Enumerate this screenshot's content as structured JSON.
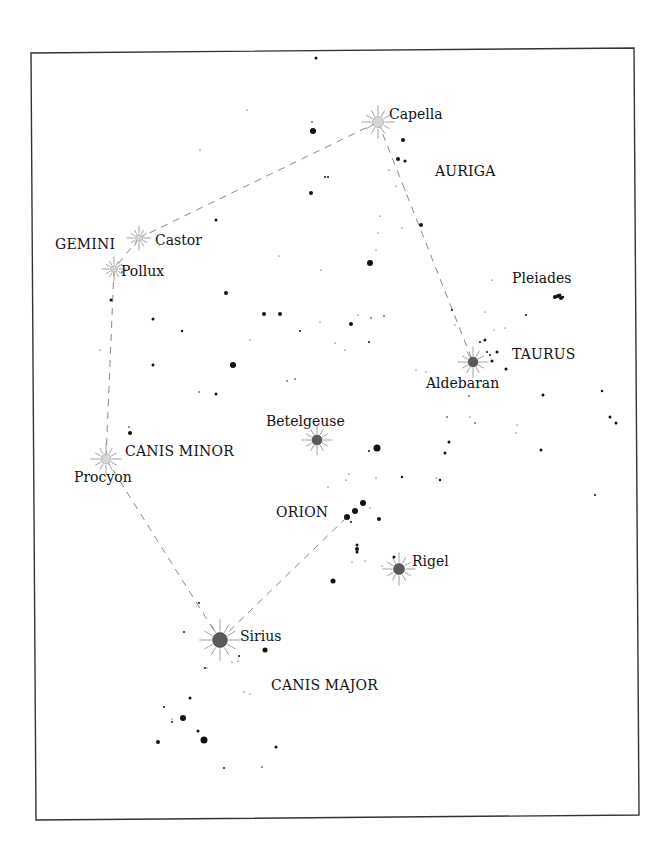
{
  "frame": {
    "corners": [
      [
        31,
        53
      ],
      [
        634,
        48
      ],
      [
        639,
        815
      ],
      [
        36,
        820
      ]
    ],
    "stroke": "#333333"
  },
  "colors": {
    "star": "#111111",
    "line": "#888888",
    "bright_light": "#d6d6d6",
    "bright_dark": "#5a5a5a",
    "ray": "#8a8a8a"
  },
  "constellations": [
    {
      "name": "AURIGA",
      "x": 435,
      "y": 176
    },
    {
      "name": "GEMINI",
      "x": 55,
      "y": 249
    },
    {
      "name": "TAURUS",
      "x": 512,
      "y": 359
    },
    {
      "name": "CANIS MINOR",
      "x": 125,
      "y": 456
    },
    {
      "name": "ORION",
      "x": 276,
      "y": 517
    },
    {
      "name": "CANIS MAJOR",
      "x": 271,
      "y": 690
    }
  ],
  "bright_stars": [
    {
      "name": "Capella",
      "x": 378,
      "y": 122,
      "r": 5.5,
      "style": "light",
      "label_x": 389,
      "label_y": 119
    },
    {
      "name": "Castor",
      "x": 139,
      "y": 238,
      "r": 3.5,
      "style": "light",
      "label_x": 155,
      "label_y": 245
    },
    {
      "name": "Pollux",
      "x": 114,
      "y": 269,
      "r": 3.5,
      "style": "light",
      "label_x": 121,
      "label_y": 276
    },
    {
      "name": "Aldebaran",
      "x": 473,
      "y": 362,
      "r": 5,
      "style": "dark",
      "label_x": 426,
      "label_y": 388
    },
    {
      "name": "Betelgeuse",
      "x": 317,
      "y": 440,
      "r": 5,
      "style": "dark",
      "label_x": 266,
      "label_y": 426
    },
    {
      "name": "Procyon",
      "x": 106,
      "y": 459,
      "r": 5,
      "style": "light",
      "label_x": 74,
      "label_y": 482
    },
    {
      "name": "Rigel",
      "x": 399,
      "y": 569,
      "r": 5.5,
      "style": "dark",
      "label_x": 412,
      "label_y": 566
    },
    {
      "name": "Sirius",
      "x": 220,
      "y": 640,
      "r": 7.5,
      "style": "dark",
      "label_x": 240,
      "label_y": 641
    }
  ],
  "labels_extra": [
    {
      "name": "Pleiades",
      "x": 512,
      "y": 283
    }
  ],
  "connections": [
    [
      "Capella",
      "Castor"
    ],
    [
      "Castor",
      "Pollux"
    ],
    [
      "Pollux",
      "Procyon"
    ],
    [
      "Procyon",
      "Sirius"
    ],
    [
      "Sirius",
      "Orion-belt"
    ],
    [
      "Capella",
      "Aldebaran"
    ]
  ],
  "anchors": {
    "Orion-belt": [
      347,
      517
    ]
  },
  "stars": [
    [
      316,
      58,
      1.5
    ],
    [
      247,
      110,
      0.6
    ],
    [
      313,
      131,
      3
    ],
    [
      312,
      122,
      0.8
    ],
    [
      311,
      193,
      2
    ],
    [
      325,
      177,
      1
    ],
    [
      328,
      177,
      1
    ],
    [
      403,
      140,
      2
    ],
    [
      398,
      159,
      2
    ],
    [
      405,
      161,
      1.5
    ],
    [
      389,
      170,
      0.6
    ],
    [
      396,
      186,
      0.6
    ],
    [
      405,
      190,
      0.6
    ],
    [
      421,
      225,
      2
    ],
    [
      402,
      228,
      0.6
    ],
    [
      380,
      216,
      0.6
    ],
    [
      378,
      233,
      0.6
    ],
    [
      376,
      250,
      0.6
    ],
    [
      216,
      220,
      1.5
    ],
    [
      200,
      150,
      0.6
    ],
    [
      370,
      263,
      3
    ],
    [
      279,
      256,
      0.6
    ],
    [
      321,
      270,
      0.6
    ],
    [
      226,
      293,
      2
    ],
    [
      264,
      314,
      2
    ],
    [
      280,
      314,
      2
    ],
    [
      153,
      319,
      1.5
    ],
    [
      182,
      331,
      1.2
    ],
    [
      300,
      331,
      1
    ],
    [
      351,
      324,
      2
    ],
    [
      369,
      342,
      1
    ],
    [
      358,
      315,
      0.6
    ],
    [
      371,
      318,
      0.8
    ],
    [
      384,
      316,
      0.8
    ],
    [
      320,
      322,
      0.6
    ],
    [
      233,
      365,
      3
    ],
    [
      153,
      365,
      1.5
    ],
    [
      216,
      394,
      1.5
    ],
    [
      199,
      392,
      0.8
    ],
    [
      287,
      381,
      0.8
    ],
    [
      295,
      379,
      0.8
    ],
    [
      250,
      340,
      0.6
    ],
    [
      335,
      343,
      0.6
    ],
    [
      345,
      350,
      0.6
    ],
    [
      111,
      300,
      1.5
    ],
    [
      100,
      350,
      0.6
    ],
    [
      130,
      433,
      2
    ],
    [
      129,
      427,
      0.8
    ],
    [
      122,
      272,
      0.8
    ],
    [
      485,
      340,
      1.5
    ],
    [
      487,
      352,
      1
    ],
    [
      492,
      361,
      1.5
    ],
    [
      497,
      352,
      1.5
    ],
    [
      506,
      369,
      1.5
    ],
    [
      490,
      355,
      1
    ],
    [
      485,
      312,
      0.6
    ],
    [
      494,
      330,
      0.6
    ],
    [
      455,
      325,
      0.6
    ],
    [
      416,
      370,
      0.6
    ],
    [
      426,
      372,
      0.6
    ],
    [
      452,
      310,
      1
    ],
    [
      492,
      280,
      0.6
    ],
    [
      526,
      315,
      1
    ],
    [
      505,
      328,
      0.6
    ],
    [
      480,
      342,
      1
    ],
    [
      555,
      297,
      2
    ],
    [
      558,
      296,
      2
    ],
    [
      561,
      298,
      2
    ],
    [
      560,
      295,
      1.5
    ],
    [
      563,
      297,
      1.2
    ],
    [
      469,
      396,
      0.8
    ],
    [
      470,
      417,
      0.6
    ],
    [
      543,
      395,
      1.5
    ],
    [
      449,
      442,
      1.5
    ],
    [
      445,
      453,
      1.5
    ],
    [
      447,
      417,
      0.8
    ],
    [
      541,
      450,
      1.5
    ],
    [
      610,
      417,
      1.5
    ],
    [
      616,
      423,
      1.5
    ],
    [
      602,
      391,
      1.2
    ],
    [
      440,
      480,
      1.2
    ],
    [
      595,
      495,
      1
    ],
    [
      517,
      425,
      0.6
    ],
    [
      516,
      433,
      0.6
    ],
    [
      475,
      423,
      0.8
    ],
    [
      377,
      448,
      3.5
    ],
    [
      369,
      451,
      1
    ],
    [
      402,
      477,
      1.2
    ],
    [
      349,
      474,
      0.6
    ],
    [
      376,
      478,
      0.6
    ],
    [
      328,
      487,
      0.6
    ],
    [
      346,
      480,
      0.6
    ],
    [
      436,
      478,
      0.6
    ],
    [
      347,
      517,
      3
    ],
    [
      355,
      511,
      3
    ],
    [
      363,
      503,
      3
    ],
    [
      351,
      522,
      1
    ],
    [
      370,
      508,
      0.6
    ],
    [
      379,
      519,
      2
    ],
    [
      357,
      545,
      1.5
    ],
    [
      357,
      549,
      2
    ],
    [
      357,
      552,
      1.5
    ],
    [
      352,
      562,
      0.6
    ],
    [
      365,
      561,
      0.6
    ],
    [
      394,
      557,
      1.5
    ],
    [
      382,
      566,
      0.6
    ],
    [
      333,
      581,
      2.5
    ],
    [
      199,
      603,
      1
    ],
    [
      184,
      632,
      1
    ],
    [
      239,
      656,
      1
    ],
    [
      238,
      661,
      0.6
    ],
    [
      232,
      662,
      0.6
    ],
    [
      265,
      650,
      2.5
    ],
    [
      205,
      668,
      1
    ],
    [
      207,
      668,
      0.6
    ],
    [
      190,
      698,
      1.5
    ],
    [
      244,
      692,
      0.6
    ],
    [
      250,
      694,
      0.6
    ],
    [
      164,
      707,
      1
    ],
    [
      183,
      718,
      3
    ],
    [
      172,
      722,
      1
    ],
    [
      172,
      719,
      0.6
    ],
    [
      198,
      731,
      1.5
    ],
    [
      204,
      740,
      3.5
    ],
    [
      158,
      742,
      2
    ],
    [
      276,
      747,
      1.5
    ],
    [
      224,
      768,
      1
    ],
    [
      262,
      767,
      0.8
    ]
  ]
}
